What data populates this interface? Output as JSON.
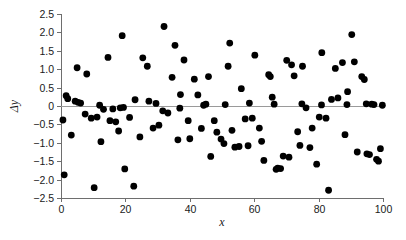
{
  "chart_data": {
    "type": "scatter",
    "title": "",
    "xlabel": "x",
    "ylabel": "Δy",
    "xlim": [
      0,
      100
    ],
    "ylim": [
      -2.5,
      2.5
    ],
    "grid": false,
    "legend": null,
    "zero_reference_line": 0,
    "xticks": [
      0,
      20,
      40,
      60,
      80,
      100
    ],
    "xtick_labels": [
      "0",
      "20",
      "40",
      "60",
      "80",
      "100"
    ],
    "yticks": [
      2.5,
      2.0,
      1.5,
      1.0,
      0.5,
      0,
      -0.5,
      -1.0,
      -1.5,
      -2.0,
      -2.5
    ],
    "ytick_labels": [
      "2.5",
      "2.0",
      "1.5",
      "1.0",
      "0.5",
      "0",
      "−0.5",
      "−1.0",
      "−1.5",
      "−2.0",
      "−2.5"
    ],
    "marker": "circle",
    "marker_color": "#000000",
    "marker_size": 3.4,
    "n_points": 120,
    "points": [
      [
        0.6,
        -0.38
      ],
      [
        1.0,
        -1.87
      ],
      [
        1.6,
        0.28
      ],
      [
        2.1,
        0.2
      ],
      [
        3.2,
        -0.79
      ],
      [
        4.4,
        0.13
      ],
      [
        5.0,
        1.04
      ],
      [
        5.3,
        0.1
      ],
      [
        6.1,
        0.08
      ],
      [
        7.5,
        -0.22
      ],
      [
        8.0,
        0.87
      ],
      [
        9.4,
        -0.33
      ],
      [
        10.3,
        -2.22
      ],
      [
        11.2,
        -0.3
      ],
      [
        12.4,
        -0.97
      ],
      [
        13.2,
        -0.09
      ],
      [
        14.6,
        1.32
      ],
      [
        15.2,
        -0.4
      ],
      [
        16.1,
        -0.08
      ],
      [
        17.0,
        -0.43
      ],
      [
        17.9,
        -0.68
      ],
      [
        19.0,
        1.91
      ],
      [
        19.4,
        -0.04
      ],
      [
        19.8,
        -1.71
      ],
      [
        21.3,
        -0.31
      ],
      [
        22.6,
        -2.18
      ],
      [
        23.0,
        0.17
      ],
      [
        24.5,
        -0.84
      ],
      [
        25.4,
        1.31
      ],
      [
        26.8,
        1.08
      ],
      [
        27.3,
        0.13
      ],
      [
        28.6,
        -0.6
      ],
      [
        30.4,
        -0.52
      ],
      [
        31.6,
        -0.13
      ],
      [
        32.0,
        2.16
      ],
      [
        33.2,
        -0.19
      ],
      [
        34.5,
        0.78
      ],
      [
        35.4,
        1.65
      ],
      [
        36.3,
        -0.92
      ],
      [
        37.1,
        0.31
      ],
      [
        38.2,
        1.25
      ],
      [
        39.5,
        -0.4
      ],
      [
        40.0,
        -0.89
      ],
      [
        41.4,
        0.73
      ],
      [
        42.5,
        0.3
      ],
      [
        43.6,
        -0.61
      ],
      [
        44.3,
        0.02
      ],
      [
        45.8,
        0.8
      ],
      [
        46.5,
        -1.37
      ],
      [
        47.6,
        -0.4
      ],
      [
        48.4,
        -0.71
      ],
      [
        49.7,
        -0.9
      ],
      [
        50.6,
        -1.02
      ],
      [
        51.9,
        1.08
      ],
      [
        52.4,
        1.71
      ],
      [
        53.1,
        -0.66
      ],
      [
        54.0,
        -1.12
      ],
      [
        55.3,
        -1.1
      ],
      [
        56.0,
        0.47
      ],
      [
        57.2,
        -0.35
      ],
      [
        58.1,
        -1.08
      ],
      [
        59.4,
        -0.33
      ],
      [
        60.2,
        1.38
      ],
      [
        61.6,
        -0.6
      ],
      [
        62.3,
        -0.96
      ],
      [
        63.0,
        -1.48
      ],
      [
        64.5,
        0.85
      ],
      [
        65.0,
        0.8
      ],
      [
        65.6,
        0.24
      ],
      [
        66.8,
        -1.72
      ],
      [
        67.3,
        -1.69
      ],
      [
        68.2,
        -1.7
      ],
      [
        69.0,
        -1.36
      ],
      [
        70.1,
        1.24
      ],
      [
        70.8,
        -1.39
      ],
      [
        71.6,
        1.12
      ],
      [
        72.4,
        0.82
      ],
      [
        73.5,
        -0.7
      ],
      [
        74.2,
        -1.07
      ],
      [
        75.0,
        1.08
      ],
      [
        76.1,
        -0.05
      ],
      [
        77.3,
        -1.13
      ],
      [
        78.0,
        -0.6
      ],
      [
        79.4,
        -1.58
      ],
      [
        80.2,
        -0.3
      ],
      [
        81.0,
        1.45
      ],
      [
        82.3,
        -0.33
      ],
      [
        83.1,
        -2.29
      ],
      [
        84.0,
        0.18
      ],
      [
        85.2,
        1.02
      ],
      [
        86.0,
        0.22
      ],
      [
        87.4,
        1.18
      ],
      [
        88.2,
        -0.78
      ],
      [
        89.0,
        0.39
      ],
      [
        90.3,
        1.94
      ],
      [
        91.1,
        1.2
      ],
      [
        92.0,
        -1.25
      ],
      [
        93.4,
        0.8
      ],
      [
        94.2,
        0.72
      ],
      [
        95.0,
        -1.3
      ],
      [
        95.8,
        -1.32
      ],
      [
        96.5,
        0.05
      ],
      [
        97.2,
        0.04
      ],
      [
        98.0,
        -1.45
      ],
      [
        98.6,
        -1.5
      ],
      [
        99.2,
        -1.16
      ],
      [
        99.8,
        0.02
      ],
      [
        12.0,
        0.02
      ],
      [
        29.5,
        0.07
      ],
      [
        45.0,
        0.05
      ],
      [
        58.5,
        0.08
      ],
      [
        74.8,
        0.06
      ],
      [
        88.8,
        0.04
      ],
      [
        18.4,
        -0.05
      ],
      [
        36.9,
        -0.06
      ],
      [
        51.0,
        0.04
      ],
      [
        66.2,
        0.05
      ],
      [
        80.9,
        0.03
      ],
      [
        94.8,
        0.06
      ]
    ]
  },
  "axes_geometry": {
    "plot_left_px": 61,
    "plot_right_px": 383,
    "plot_top_px": 14,
    "plot_bottom_px": 198
  }
}
